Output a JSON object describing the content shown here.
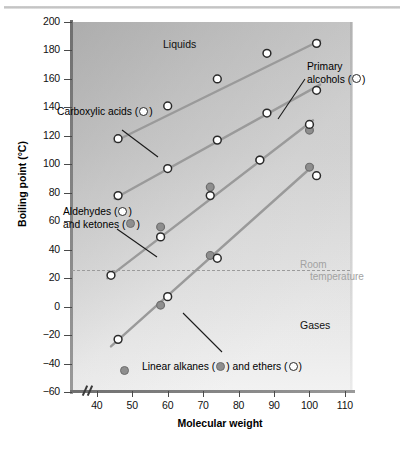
{
  "figure": {
    "background": "#ffffff",
    "plot_bg_light": "#f2f2f2",
    "plot_bg_dark": "#c9c9c9"
  },
  "axis": {
    "y_title": "Boiling point (°C)",
    "x_title": "Molecular weight",
    "y_ticks": [
      "200",
      "180",
      "160",
      "140",
      "120",
      "100",
      "80",
      "60",
      "40",
      "20",
      "0",
      "−20",
      "−40",
      "−60"
    ],
    "x_ticks": [
      "40",
      "50",
      "60",
      "70",
      "80",
      "90",
      "100",
      "110"
    ]
  },
  "regions": {
    "liquids": "Liquids",
    "gases": "Gases"
  },
  "annotations": {
    "room_temperature_line1": "Room",
    "room_temperature_line2": "temperature",
    "room_temperature_value": 26,
    "room_temperature_color": "#a2a2a2"
  },
  "callouts": {
    "carboxylic_acids": "Carboxylic acids (",
    "carboxylic_acids_tail": ")",
    "primary_alcohols_line1": "Primary",
    "primary_alcohols_line2a": "alcohols (",
    "primary_alcohols_line2b": ")",
    "aldehydes_line1a": "Aldehydes (",
    "aldehydes_line1b": ")",
    "aldehydes_line2a": "and ketones (",
    "aldehydes_line2b": ")",
    "alkanes_a": "Linear alkanes (",
    "alkanes_b": ") and ethers (",
    "alkanes_c": ")"
  },
  "chart_data": {
    "type": "scatter",
    "title": "",
    "xlabel": "Molecular weight",
    "ylabel": "Boiling point (°C)",
    "xlim": [
      33,
      112
    ],
    "ylim": [
      -60,
      200
    ],
    "grid": false,
    "legend": "inline-callouts",
    "marker_open_color": "#ffffff",
    "marker_open_edge": "#2a2a2a",
    "marker_filled_color": "#8e8e8e",
    "marker_filled_edge": "#6d6d6d",
    "trendline_color": "#9a9a9a",
    "series": [
      {
        "name": "Carboxylic acids",
        "marker": "open",
        "points": [
          {
            "x": 46,
            "y": 118
          },
          {
            "x": 60,
            "y": 141
          },
          {
            "x": 74,
            "y": 160
          },
          {
            "x": 88,
            "y": 178
          },
          {
            "x": 102,
            "y": 185
          }
        ],
        "trend": {
          "x1": 45,
          "y1": 116,
          "x2": 103,
          "y2": 187
        }
      },
      {
        "name": "Primary alcohols",
        "marker": "open",
        "points": [
          {
            "x": 46,
            "y": 78
          },
          {
            "x": 60,
            "y": 97
          },
          {
            "x": 74,
            "y": 117
          },
          {
            "x": 88,
            "y": 136
          },
          {
            "x": 102,
            "y": 152
          }
        ],
        "trend": {
          "x1": 45,
          "y1": 76,
          "x2": 103,
          "y2": 156
        }
      },
      {
        "name": "Aldehydes",
        "marker": "open",
        "points": [
          {
            "x": 44,
            "y": 22
          },
          {
            "x": 58,
            "y": 49
          },
          {
            "x": 72,
            "y": 78
          },
          {
            "x": 86,
            "y": 103
          },
          {
            "x": 100,
            "y": 128
          }
        ],
        "trend": {
          "x1": 43,
          "y1": 20,
          "x2": 101,
          "y2": 131
        }
      },
      {
        "name": "Ketones",
        "marker": "filled",
        "points": [
          {
            "x": 58,
            "y": 56
          },
          {
            "x": 72,
            "y": 84
          },
          {
            "x": 86,
            "y": 103
          },
          {
            "x": 100,
            "y": 124
          }
        ],
        "trend": null
      },
      {
        "name": "Ethers",
        "marker": "open",
        "points": [
          {
            "x": 46,
            "y": -23
          },
          {
            "x": 60,
            "y": 7
          },
          {
            "x": 74,
            "y": 34
          },
          {
            "x": 102,
            "y": 92
          }
        ],
        "trend": {
          "x1": 44,
          "y1": -28,
          "x2": 101,
          "y2": 99
        }
      },
      {
        "name": "Linear alkanes",
        "marker": "filled",
        "points": [
          {
            "x": 58,
            "y": 1
          },
          {
            "x": 72,
            "y": 36
          },
          {
            "x": 100,
            "y": 98
          }
        ],
        "trend": null
      }
    ]
  }
}
